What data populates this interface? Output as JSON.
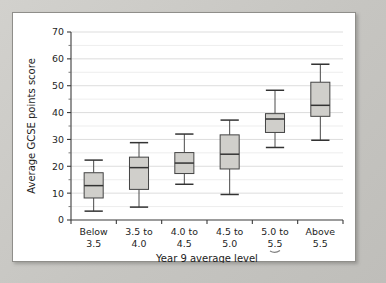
{
  "chart_data": {
    "type": "box",
    "title": "",
    "xlabel": "Year 9 average level",
    "ylabel": "Average GCSE points score",
    "ylim": [
      0,
      70
    ],
    "ytick_labels": [
      "0",
      "10",
      "20",
      "30",
      "40",
      "50",
      "60",
      "70"
    ],
    "ytick_values": [
      0,
      10,
      20,
      30,
      40,
      50,
      60,
      70
    ],
    "minor_tick_step": 5,
    "grid": "horizontal-minor-and-major",
    "legend": "none",
    "categories": [
      "Below\n3.5",
      "3.5 to\n4.0",
      "4.0 to\n4.5",
      "4.5 to\n5.0",
      "5.0 to\n5.5",
      "Above\n5.5"
    ],
    "category_lines": [
      [
        "Below",
        "3.5"
      ],
      [
        "3.5 to",
        "4.0"
      ],
      [
        "4.0 to",
        "4.5"
      ],
      [
        "4.5 to",
        "5.0"
      ],
      [
        "5.0 to",
        "5.5"
      ],
      [
        "Above",
        "5.5"
      ]
    ],
    "boxes": [
      {
        "category": "Below 3.5",
        "whisker_low": 3.3,
        "q1": 8.2,
        "median": 12.8,
        "q3": 17.6,
        "whisker_high": 22.3
      },
      {
        "category": "3.5 to 4.0",
        "whisker_low": 4.8,
        "q1": 11.4,
        "median": 19.5,
        "q3": 23.4,
        "whisker_high": 28.8
      },
      {
        "category": "4.0 to 4.5",
        "whisker_low": 13.3,
        "q1": 17.3,
        "median": 21.2,
        "q3": 25.1,
        "whisker_high": 32.0
      },
      {
        "category": "4.5 to 5.0",
        "whisker_low": 9.5,
        "q1": 19.0,
        "median": 24.5,
        "q3": 31.7,
        "whisker_high": 37.2
      },
      {
        "category": "5.0 to 5.5",
        "whisker_low": 27.0,
        "q1": 32.6,
        "median": 37.6,
        "q3": 39.6,
        "whisker_high": 48.3
      },
      {
        "category": "Above 5.5",
        "whisker_low": 29.7,
        "q1": 38.6,
        "median": 42.7,
        "q3": 51.3,
        "whisker_high": 58.0
      }
    ]
  },
  "annotations": {
    "pen_mark": "small-underline-mark-below-5.5"
  }
}
